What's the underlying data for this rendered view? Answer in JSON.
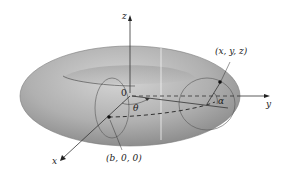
{
  "figure": {
    "type": "torus-diagram",
    "colors": {
      "background": "#ffffff",
      "torus_light": "#c9c9c9",
      "torus_mid": "#a6a6a6",
      "torus_dark": "#7f7f7f",
      "lines": "#333333"
    }
  },
  "labels": {
    "z_axis": "z",
    "y_axis": "y",
    "x_axis": "x",
    "origin": "0",
    "theta": "θ",
    "alpha": "α",
    "point_xyz": "(x, y, z)",
    "point_b00": "(b, 0, 0)"
  }
}
